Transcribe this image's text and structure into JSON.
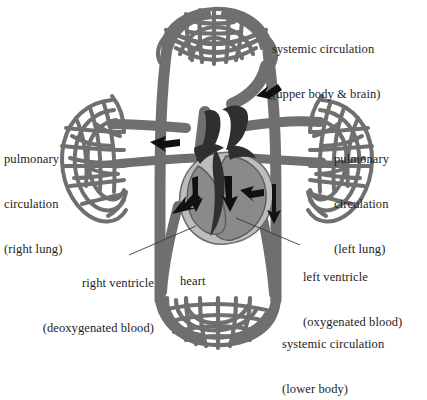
{
  "figure": {
    "palette": {
      "vessel": "#6f6f70",
      "vessel_stroke": "#4a4a4b",
      "heart_light": "#bdbdbd",
      "heart_mid": "#8a8a8a",
      "heart_dark": "#2f2f2f",
      "arrow": "#111111",
      "background": "#ffffff",
      "text": "#1d1d1d",
      "leader": "#3a3a3a"
    }
  },
  "labels": {
    "systemic_upper": {
      "line1": "systemic circulation",
      "line2": "(upper body & brain)"
    },
    "pulmonary_right": {
      "line1": "pulmonary",
      "line2": "circulation",
      "line3": "(right lung)"
    },
    "pulmonary_left": {
      "line1": "pulmonary",
      "line2": "circulation",
      "line3": "(left lung)"
    },
    "right_ventricle": {
      "line1": "right ventricle",
      "line2": "(deoxygenated blood)"
    },
    "left_ventricle": {
      "line1": "left ventricle",
      "line2": "(oxygenated blood)"
    },
    "heart": {
      "line1": "heart"
    },
    "systemic_lower": {
      "line1": "systemic circulation",
      "line2": "(lower body)"
    }
  },
  "regions": [
    {
      "name": "upper-body-capillary-bed",
      "label_ref": "systemic_upper"
    },
    {
      "name": "right-lung-capillary-bed",
      "label_ref": "pulmonary_right"
    },
    {
      "name": "left-lung-capillary-bed",
      "label_ref": "pulmonary_left"
    },
    {
      "name": "lower-body-capillary-bed",
      "label_ref": "systemic_lower"
    },
    {
      "name": "heart",
      "label_ref": "heart"
    }
  ]
}
